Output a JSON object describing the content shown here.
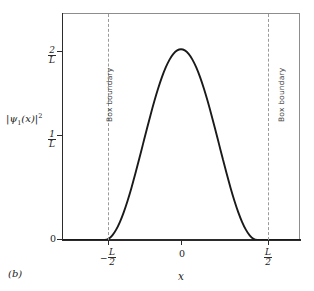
{
  "figure": {
    "panel_label": "(b)",
    "background_color": "#ffffff",
    "curve_color": "#1a1a1a",
    "boundary_color": "#9a9a9a",
    "axis_color": "#2b2b2b"
  },
  "axes": {
    "y_title_parts": {
      "bar_open": "|",
      "psi": "ψ",
      "subscript": "1",
      "argument": "(x)",
      "bar_close": "|",
      "exponent": "2"
    },
    "x_title": "x",
    "y_ticks": [
      {
        "value": 0,
        "label": "0",
        "kind": "plain"
      },
      {
        "value": 1,
        "numerator": "1",
        "denominator": "L",
        "kind": "fraction"
      },
      {
        "value": 2,
        "numerator": "2",
        "denominator": "L",
        "kind": "fraction"
      }
    ],
    "x_ticks": [
      {
        "value": -0.5,
        "sign": "−",
        "numerator": "L",
        "denominator": "2",
        "kind": "fraction"
      },
      {
        "value": 0,
        "label": "0",
        "kind": "plain"
      },
      {
        "value": 0.5,
        "sign": "",
        "numerator": "L",
        "denominator": "2",
        "kind": "fraction"
      }
    ],
    "y_range": [
      0,
      2.38
    ],
    "x_range": [
      -0.78,
      0.78
    ],
    "grid": false
  },
  "annotations": [
    {
      "name": "box-boundary-left",
      "text": "Box boundary",
      "x": -0.5,
      "orientation": "vertical"
    },
    {
      "name": "box-boundary-right",
      "text": "Box boundary",
      "x": 0.5,
      "orientation": "vertical"
    }
  ],
  "chart_data": {
    "type": "line",
    "title": "",
    "subtitle": "",
    "xlabel": "x",
    "ylabel": "|ψ₁(x)|²",
    "xlim": [
      -0.78,
      0.78
    ],
    "ylim": [
      0,
      2.38
    ],
    "grid": false,
    "legend": null,
    "x_tick_labels": [
      "-L/2",
      "0",
      "L/2"
    ],
    "x_tick_values": [
      -0.5,
      0,
      0.5
    ],
    "y_tick_labels": [
      "0",
      "1/L",
      "2/L"
    ],
    "y_tick_values": [
      0,
      1,
      2
    ],
    "series": [
      {
        "name": "|psi_1(x)|^2",
        "units": "1/L",
        "color": "#1a1a1a",
        "x": [
          -0.78,
          -0.7,
          -0.6,
          -0.55,
          -0.5,
          -0.475,
          -0.45,
          -0.425,
          -0.4,
          -0.375,
          -0.35,
          -0.325,
          -0.3,
          -0.275,
          -0.25,
          -0.225,
          -0.2,
          -0.175,
          -0.15,
          -0.125,
          -0.1,
          -0.075,
          -0.05,
          -0.025,
          0.0,
          0.025,
          0.05,
          0.075,
          0.1,
          0.125,
          0.15,
          0.175,
          0.2,
          0.225,
          0.25,
          0.275,
          0.3,
          0.325,
          0.35,
          0.375,
          0.4,
          0.425,
          0.45,
          0.475,
          0.5,
          0.55,
          0.6,
          0.7,
          0.78
        ],
        "y": [
          0.0,
          0.0,
          0.0,
          0.0,
          0.0,
          0.0123,
          0.0489,
          0.109,
          0.191,
          0.2929,
          0.4122,
          0.546,
          0.691,
          0.8436,
          1.0,
          1.1564,
          1.309,
          1.454,
          1.5878,
          1.7071,
          1.809,
          1.891,
          1.9511,
          1.9877,
          2.0,
          1.9877,
          1.9511,
          1.891,
          1.809,
          1.7071,
          1.5878,
          1.454,
          1.309,
          1.1564,
          1.0,
          0.8436,
          0.691,
          0.546,
          0.4122,
          0.2929,
          0.191,
          0.109,
          0.0489,
          0.0123,
          0.0,
          0.0,
          0.0,
          0.0,
          0.0
        ]
      }
    ],
    "annotations": [
      {
        "text": "Box boundary",
        "x": -0.5,
        "style": "dashed-vertical-line"
      },
      {
        "text": "Box boundary",
        "x": 0.5,
        "style": "dashed-vertical-line"
      }
    ]
  }
}
